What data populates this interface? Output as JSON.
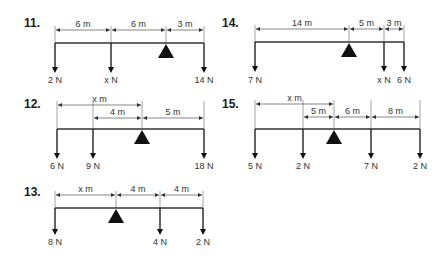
{
  "problems": [
    {
      "id": "p11",
      "label": "11.",
      "lx": 24,
      "ly": 27,
      "beam": {
        "x1": 55,
        "x2": 204,
        "y": 43
      },
      "pivot": 166,
      "dims": [
        {
          "x1": 55,
          "x2": 111,
          "y": 30,
          "text": "6 m"
        },
        {
          "x1": 111,
          "x2": 166,
          "y": 30,
          "text": "6 m"
        },
        {
          "x1": 166,
          "x2": 204,
          "y": 30,
          "text": "3 m"
        }
      ],
      "forces": [
        {
          "x": 55,
          "text": "2 N"
        },
        {
          "x": 111,
          "text": "x N"
        },
        {
          "x": 204,
          "text": "14 N"
        }
      ],
      "arrow_end": 73,
      "label_y": 83
    },
    {
      "id": "p14",
      "label": "14.",
      "lx": 222,
      "ly": 27,
      "beam": {
        "x1": 255,
        "x2": 404,
        "y": 42
      },
      "pivot": 349,
      "dims": [
        {
          "x1": 255,
          "x2": 349,
          "y": 29,
          "text": "14 m"
        },
        {
          "x1": 349,
          "x2": 384,
          "y": 29,
          "text": "5 m"
        },
        {
          "x1": 384,
          "x2": 404,
          "y": 29,
          "text": "3 m"
        }
      ],
      "forces": [
        {
          "x": 255,
          "text": "7 N"
        },
        {
          "x": 384,
          "text": "x N"
        },
        {
          "x": 404,
          "text": "6 N"
        }
      ],
      "arrow_end": 72,
      "label_y": 83
    },
    {
      "id": "p12",
      "label": "12.",
      "lx": 24,
      "ly": 108,
      "beam": {
        "x1": 57,
        "x2": 204,
        "y": 129
      },
      "pivot": 142,
      "dims": [
        {
          "x1": 57,
          "x2": 142,
          "y": 105,
          "text": "x m"
        },
        {
          "x1": 93,
          "x2": 142,
          "y": 118,
          "text": "4 m"
        },
        {
          "x1": 142,
          "x2": 204,
          "y": 118,
          "text": "5 m"
        }
      ],
      "forces": [
        {
          "x": 57,
          "text": "6 N"
        },
        {
          "x": 93,
          "text": "9 N"
        },
        {
          "x": 204,
          "text": "18 N"
        }
      ],
      "arrow_end": 159,
      "label_y": 169
    },
    {
      "id": "p15",
      "label": "15.",
      "lx": 222,
      "ly": 108,
      "beam": {
        "x1": 255,
        "x2": 420,
        "y": 129
      },
      "pivot": 334,
      "dims": [
        {
          "x1": 255,
          "x2": 334,
          "y": 104,
          "text": "x m"
        },
        {
          "x1": 303,
          "x2": 334,
          "y": 117,
          "text": "5 m"
        },
        {
          "x1": 334,
          "x2": 371,
          "y": 117,
          "text": "6 m"
        },
        {
          "x1": 371,
          "x2": 420,
          "y": 117,
          "text": "8 m"
        }
      ],
      "forces": [
        {
          "x": 255,
          "text": "5 N"
        },
        {
          "x": 303,
          "text": "2 N"
        },
        {
          "x": 371,
          "text": "7 N"
        },
        {
          "x": 420,
          "text": "2 N"
        }
      ],
      "arrow_end": 159,
      "label_y": 169
    },
    {
      "id": "p13",
      "label": "13.",
      "lx": 24,
      "ly": 196,
      "beam": {
        "x1": 55,
        "x2": 203,
        "y": 208
      },
      "pivot": 116,
      "dims": [
        {
          "x1": 55,
          "x2": 116,
          "y": 195,
          "text": "x m"
        },
        {
          "x1": 116,
          "x2": 160,
          "y": 195,
          "text": "4 m"
        },
        {
          "x1": 160,
          "x2": 203,
          "y": 195,
          "text": "4 m"
        }
      ],
      "forces": [
        {
          "x": 55,
          "text": "8 N"
        },
        {
          "x": 160,
          "text": "4 N"
        },
        {
          "x": 203,
          "text": "2 N"
        }
      ],
      "arrow_end": 235,
      "label_y": 245
    }
  ]
}
